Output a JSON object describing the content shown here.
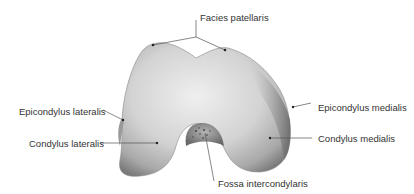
{
  "diagram": {
    "labels": {
      "facies_patellaris": "Facies patellaris",
      "epicondylus_lateralis": "Epicondylus lateralis",
      "condylus_lateralis": "Condylus lateralis",
      "epicondylus_medialis": "Epicondylus medialis",
      "condylus_medialis": "Condylus medialis",
      "fossa_intercondylaris": "Fossa intercondylaris"
    },
    "colors": {
      "label_text": "#333333",
      "leader_line": "#555555",
      "bone_light": "#e6e6e6",
      "bone_mid": "#bdbdbd",
      "bone_dark": "#6f6f6f"
    }
  }
}
